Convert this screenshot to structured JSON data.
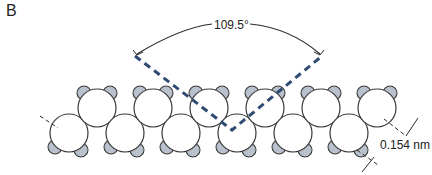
{
  "figure": {
    "panel_label": "B",
    "angle_label": "109.5°",
    "bond_length_label": "0.154 nm",
    "colors": {
      "bond_dash": "#2f4a72",
      "hydrogen_fill": "#b9c2cc",
      "carbon_fill": "#ffffff",
      "outline": "#3a3a3a"
    },
    "molecule": {
      "description": "zigzag carbon chain space-filling model",
      "carbon_count": 12,
      "hydrogen_count": 24
    }
  }
}
